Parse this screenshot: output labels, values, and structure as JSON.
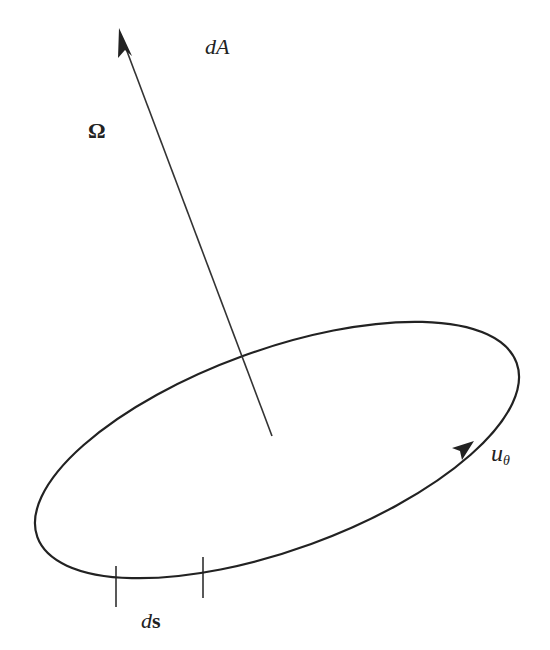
{
  "diagram": {
    "stroke_color": "#222222",
    "background": "#ffffff",
    "labels": {
      "area_element": "dA",
      "normal_vector": "Ω",
      "tangent_unit_vector_base": "u",
      "tangent_unit_vector_sub": "θ",
      "line_element_d": "d",
      "line_element_s": "s"
    },
    "elements": {
      "loop": {
        "shape": "tilted ellipse",
        "cx": 277,
        "cy": 450,
        "rx": 255,
        "ry": 100,
        "rotation_deg": -20
      },
      "normal_arrow": {
        "from": [
          272,
          436
        ],
        "to": [
          120,
          30
        ]
      },
      "tangent_arrowhead": {
        "at": [
          470,
          445
        ],
        "direction": "up-right along loop"
      },
      "ds_ticks": [
        {
          "x": 116,
          "y1": 566,
          "y2": 607
        },
        {
          "x": 203,
          "y1": 557,
          "y2": 598
        }
      ]
    }
  }
}
